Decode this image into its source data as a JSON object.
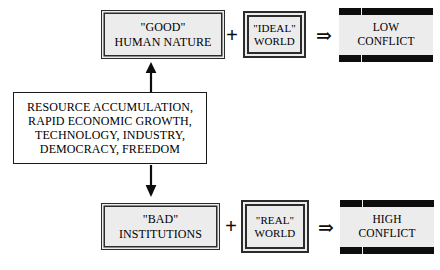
{
  "diagram": {
    "type": "flow-diagram",
    "title": "",
    "background_color": "#ffffff",
    "text_color": "#000000",
    "fill_color": "#ececec",
    "border_color": "#2b2b2b",
    "bar_color": "#0d0d0d",
    "nodes": [
      {
        "id": "good-human-nature",
        "label": "\"GOOD\"\nHUMAN NATURE",
        "style": "box-double",
        "row": "top"
      },
      {
        "id": "ideal-world",
        "label": "\"IDEAL\"\nWORLD",
        "style": "box-double-heavy",
        "row": "top"
      },
      {
        "id": "low-conflict",
        "label": "LOW\nCONFLICT",
        "style": "box-bars",
        "row": "top"
      },
      {
        "id": "drivers",
        "label": "RESOURCE ACCUMULATION,\nRAPID ECONOMIC GROWTH,\nTECHNOLOGY, INDUSTRY,\nDEMOCRACY, FREEDOM",
        "style": "box-plain",
        "row": "middle"
      },
      {
        "id": "bad-institutions",
        "label": "\"BAD\"\nINSTITUTIONS",
        "style": "box-double",
        "row": "bottom"
      },
      {
        "id": "real-world",
        "label": "\"REAL\"\nWORLD",
        "style": "box-double-heavy",
        "row": "bottom"
      },
      {
        "id": "high-conflict",
        "label": "HIGH\nCONFLICT",
        "style": "box-bars",
        "row": "bottom"
      }
    ],
    "operators": {
      "plus_top": "+",
      "plus_bottom": "+",
      "implies_top": "⇒",
      "implies_bottom": "⇒"
    },
    "connectors": [
      {
        "id": "drivers-to-good",
        "from": "drivers",
        "to": "good-human-nature",
        "direction": "up",
        "arrowhead": "solid"
      },
      {
        "id": "drivers-to-bad",
        "from": "drivers",
        "to": "bad-institutions",
        "direction": "down",
        "arrowhead": "solid"
      }
    ]
  }
}
